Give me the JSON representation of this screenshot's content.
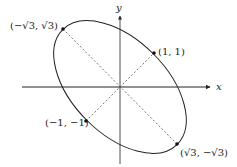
{
  "diagram": {
    "axes": {
      "x_label": "x",
      "y_label": "y"
    },
    "points": [
      {
        "id": "p1",
        "label": "(1, 1)",
        "x": 1,
        "y": 1
      },
      {
        "id": "p2",
        "label": "(−1, −1)",
        "x": -1,
        "y": -1
      },
      {
        "id": "p3",
        "label": "(−√3, √3)",
        "x": -1.732,
        "y": 1.732
      },
      {
        "id": "p4",
        "label": "(√3, −√3)",
        "x": 1.732,
        "y": -1.732
      }
    ],
    "ellipse": {
      "center": [
        0,
        0
      ],
      "major_axis_direction": "y = -x",
      "minor_axis_direction": "y = x",
      "semi_major": 2.449,
      "semi_minor": 1.414
    },
    "colors": {
      "stroke": "#222222",
      "dashed": "#555555",
      "background": "#ffffff"
    }
  }
}
